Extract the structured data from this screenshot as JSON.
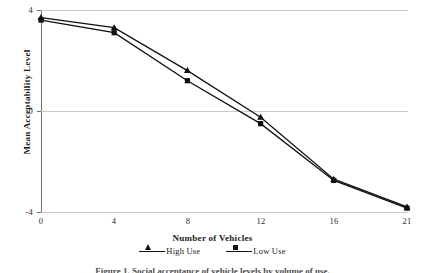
{
  "chart_data": {
    "type": "line",
    "title": "",
    "xlabel": "Number of Vehicles",
    "ylabel": "Mean Acceptability Level",
    "categories": [
      "0",
      "4",
      "8",
      "12",
      "16",
      "21"
    ],
    "ylim": [
      -4,
      4
    ],
    "yticks": [
      "4",
      "0",
      "-4"
    ],
    "ytick_values": [
      4,
      0,
      -4
    ],
    "grid": true,
    "legend_position": "bottom",
    "series": [
      {
        "name": "High Use",
        "marker": "triangle",
        "color": "#111111",
        "values": [
          3.7,
          3.3,
          1.6,
          -0.25,
          -2.7,
          -3.8
        ]
      },
      {
        "name": "Low Use",
        "marker": "square",
        "color": "#111111",
        "values": [
          3.6,
          3.1,
          1.2,
          -0.5,
          -2.75,
          -3.85
        ]
      }
    ]
  },
  "legend": {
    "items": [
      {
        "label": "High Use",
        "marker": "triangle"
      },
      {
        "label": "Low Use",
        "marker": "square"
      }
    ]
  },
  "caption": "Figure 1. Social acceptance of vehicle levels by volume of use."
}
